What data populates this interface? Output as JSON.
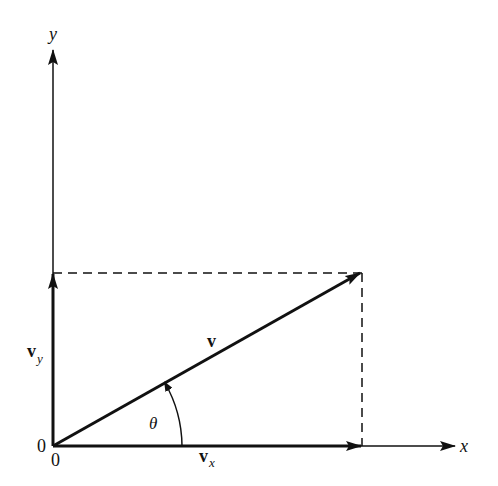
{
  "diagram": {
    "type": "vector-components",
    "axes": {
      "x_label": "x",
      "y_label": "y"
    },
    "origin_labels": {
      "vertical_origin": "0",
      "horizontal_origin": "0"
    },
    "vectors": {
      "main": {
        "label": "v",
        "from": [
          53,
          446
        ],
        "to": [
          360,
          273
        ]
      },
      "x_component": {
        "label": "v",
        "subscript": "x"
      },
      "y_component": {
        "label": "v",
        "subscript": "y"
      }
    },
    "angle": {
      "label": "θ"
    },
    "colors": {
      "ink": "#111111",
      "background": "#ffffff"
    }
  }
}
